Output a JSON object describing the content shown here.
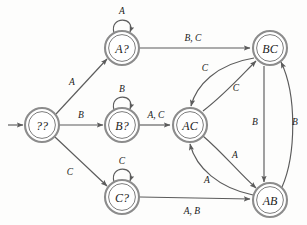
{
  "diagram": {
    "type": "finite-state-machine",
    "title": "",
    "background_color": "#fdfdfc",
    "node_stroke_color": "#8c8c8c",
    "edge_color": "#5b5b5b",
    "label_color": "#1a1a1a",
    "nodes": [
      {
        "id": "start",
        "label": "??",
        "x": 42,
        "y": 125,
        "r": 17,
        "double_ring": true
      },
      {
        "id": "aq",
        "label": "A?",
        "x": 122,
        "y": 48,
        "r": 17,
        "double_ring": true
      },
      {
        "id": "bq",
        "label": "B?",
        "x": 122,
        "y": 125,
        "r": 17,
        "double_ring": true
      },
      {
        "id": "cq",
        "label": "C?",
        "x": 122,
        "y": 197,
        "r": 17,
        "double_ring": true
      },
      {
        "id": "ac",
        "label": "AC",
        "x": 190,
        "y": 125,
        "r": 17,
        "double_ring": true
      },
      {
        "id": "bc",
        "label": "BC",
        "x": 270,
        "y": 48,
        "r": 17,
        "double_ring": true
      },
      {
        "id": "ab",
        "label": "AB",
        "x": 270,
        "y": 200,
        "r": 17,
        "double_ring": true
      }
    ],
    "initial_arrow": {
      "from_x": 8,
      "to_x": 24,
      "y": 125
    },
    "edges": [
      {
        "id": "e-start-aq",
        "from": "start",
        "to": "aq",
        "label": "A",
        "label_x": 72,
        "label_y": 82,
        "kind": "straight"
      },
      {
        "id": "e-start-bq",
        "from": "start",
        "to": "bq",
        "label": "B",
        "label_x": 81,
        "label_y": 115,
        "kind": "straight"
      },
      {
        "id": "e-start-cq",
        "from": "start",
        "to": "cq",
        "label": "C",
        "label_x": 70,
        "label_y": 172,
        "kind": "straight"
      },
      {
        "id": "e-aq-self",
        "from": "aq",
        "to": "aq",
        "label": "A",
        "label_x": 122,
        "label_y": 11,
        "kind": "self-loop"
      },
      {
        "id": "e-bq-self",
        "from": "bq",
        "to": "bq",
        "label": "B",
        "label_x": 122,
        "label_y": 89,
        "kind": "self-loop"
      },
      {
        "id": "e-cq-self",
        "from": "cq",
        "to": "cq",
        "label": "C",
        "label_x": 122,
        "label_y": 161,
        "kind": "self-loop"
      },
      {
        "id": "e-aq-bc",
        "from": "aq",
        "to": "bc",
        "label": "B, C",
        "label_x": 193,
        "label_y": 38,
        "kind": "straight"
      },
      {
        "id": "e-bq-ac",
        "from": "bq",
        "to": "ac",
        "label": "A, C",
        "label_x": 156,
        "label_y": 115,
        "kind": "straight"
      },
      {
        "id": "e-cq-ab",
        "from": "cq",
        "to": "ab",
        "label": "A, B",
        "label_x": 192,
        "label_y": 211,
        "kind": "straight"
      },
      {
        "id": "e-bc-ac",
        "from": "bc",
        "to": "ac",
        "label": "C",
        "label_x": 205,
        "label_y": 68,
        "kind": "curve"
      },
      {
        "id": "e-ac-bc",
        "from": "ac",
        "to": "bc",
        "label": "C",
        "label_x": 236,
        "label_y": 88,
        "kind": "curve"
      },
      {
        "id": "e-ac-ab",
        "from": "ac",
        "to": "ab",
        "label": "A",
        "label_x": 235,
        "label_y": 155,
        "kind": "curve"
      },
      {
        "id": "e-ab-ac",
        "from": "ab",
        "to": "ac",
        "label": "A",
        "label_x": 207,
        "label_y": 180,
        "kind": "curve"
      },
      {
        "id": "e-bc-ab",
        "from": "bc",
        "to": "ab",
        "label": "B",
        "label_x": 255,
        "label_y": 122,
        "kind": "straight"
      },
      {
        "id": "e-ab-bc",
        "from": "ab",
        "to": "bc",
        "label": "B",
        "label_x": 295,
        "label_y": 122,
        "kind": "curve"
      }
    ]
  }
}
